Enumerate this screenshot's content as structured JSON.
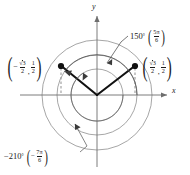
{
  "figure": {
    "type": "unit-circle-angle-diagram",
    "axes": {
      "x_label": "x",
      "y_label": "y"
    },
    "origin": {
      "x": 97,
      "y": 95
    },
    "circles": [
      {
        "name": "inner-circle",
        "radius": 26
      },
      {
        "name": "middle-circle",
        "radius": 40
      },
      {
        "name": "outer-circle",
        "radius": 55
      }
    ],
    "points": [
      {
        "name": "left-terminal-point",
        "px": {
          "x": 61,
          "y": 66
        },
        "coord_text": "(-sqrt(3)/2, 1/2)",
        "x_numerator": "3",
        "x_denominator": "2",
        "y_numerator": "1",
        "y_denominator": "2",
        "x_negative": true
      },
      {
        "name": "right-terminal-point",
        "px": {
          "x": 135,
          "y": 66
        },
        "coord_text": "(sqrt(3)/2, 1/2)",
        "x_numerator": "3",
        "x_denominator": "2",
        "y_numerator": "1",
        "y_denominator": "2",
        "x_negative": false
      }
    ],
    "angles": [
      {
        "name": "angle-150",
        "degrees_label": "150",
        "degree_symbol": "°",
        "radian_numerator": "5π",
        "radian_denominator": "6",
        "sign_prefix": "",
        "direction": "counterclockwise"
      },
      {
        "name": "angle-negative-210",
        "degrees_label": "210",
        "degree_symbol": "°",
        "radian_numerator": "7π",
        "radian_denominator": "6",
        "sign_prefix": "−",
        "radian_sign_prefix": "−",
        "direction": "clockwise"
      }
    ],
    "colors": {
      "stroke": "#1a1a1a",
      "circle": "#8c8c8c",
      "axis": "#6e6e6e",
      "dashed": "#9a9a9a",
      "background": "#ffffff"
    },
    "symbols": {
      "radical": "√",
      "pi": "π",
      "minus": "−"
    }
  }
}
